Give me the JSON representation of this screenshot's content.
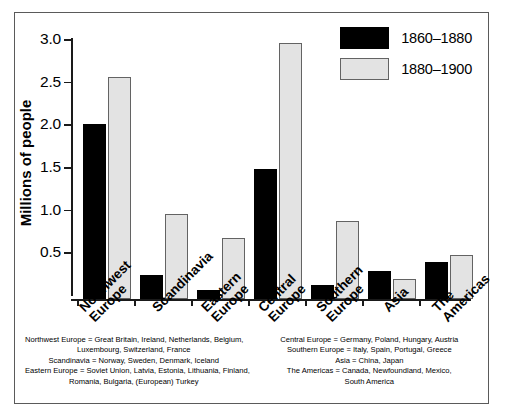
{
  "chart_data": {
    "type": "bar",
    "title": "",
    "xlabel": "",
    "ylabel": "Millions of people",
    "ylim": [
      0,
      3.0
    ],
    "yticks": [
      "0.5",
      "1.0",
      "1.5",
      "2.0",
      "2.5",
      "3.0"
    ],
    "ytick_values": [
      0.5,
      1.0,
      1.5,
      2.0,
      2.5,
      3.0
    ],
    "grid": false,
    "legend_position": "top-right",
    "categories": [
      "Northwest\nEurope",
      "Scandinavia",
      "Eastern\nEurope",
      "Central\nEurope",
      "Southern\nEurope",
      "Asia",
      "The\nAmericas"
    ],
    "series": [
      {
        "name": "1860–1880",
        "color": "#000000",
        "values": [
          2.05,
          0.28,
          0.11,
          1.52,
          0.16,
          0.33,
          0.43
        ]
      },
      {
        "name": "1880–1900",
        "color": "#e3e3e3",
        "values": [
          2.6,
          1.0,
          0.72,
          3.0,
          0.92,
          0.23,
          0.52
        ]
      }
    ]
  },
  "legend": {
    "entries": [
      {
        "label": "1860–1880"
      },
      {
        "label": "1880–1900"
      }
    ]
  },
  "notes": {
    "left": [
      "Northwest Europe = Great Britain, Ireland, Netherlands, Belgium,",
      "Luxembourg, Switzerland, France",
      "Scandinavia = Norway, Sweden, Denmark, Iceland",
      "Eastern Europe = Soviet Union, Latvia, Estonia, Lithuania, Finland,",
      "Romania, Bulgaria, (European) Turkey"
    ],
    "right": [
      "Central Europe = Germany, Poland, Hungary, Austria",
      "Southern Europe =  Italy, Spain, Portugal, Greece",
      "Asia = China, Japan",
      "The Americas = Canada, Newfoundland, Mexico,",
      "South America"
    ]
  }
}
